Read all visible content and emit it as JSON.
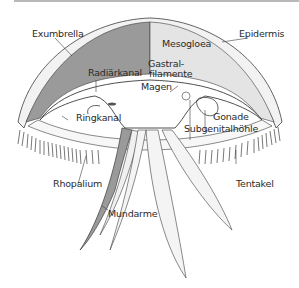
{
  "figure": {
    "colors": {
      "mesogloea_dark": "#9a9a9a",
      "mesogloea_light": "#e6e6e6",
      "line": "#3c3c3c",
      "topbar": "#b9b9b9"
    }
  },
  "labels": {
    "exumbrella": "Exumbrella",
    "mesogloea": "Mesogloea",
    "epidermis": "Epidermis",
    "radiarkanal": "Radiärkanal",
    "gastral": "Gastral-",
    "filamente": "filamente",
    "magen": "Magen",
    "ringkanal": "Ringkanal",
    "gonade": "Gonade",
    "subgenitalhoehle": "Subgenitalhöhle",
    "rhopalium": "Rhopalium",
    "tentakel": "Tentakel",
    "mundarme": "Mundarme"
  }
}
